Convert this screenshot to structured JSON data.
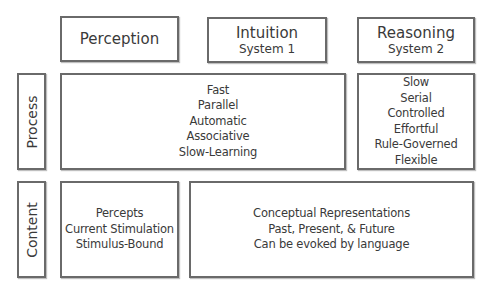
{
  "columns": {
    "perception": {
      "title": "Perception"
    },
    "intuition": {
      "title": "Intuition",
      "subtitle": "System 1"
    },
    "reasoning": {
      "title": "Reasoning",
      "subtitle": "System 2"
    }
  },
  "rows": {
    "process": {
      "label": "Process"
    },
    "content": {
      "label": "Content"
    }
  },
  "cells": {
    "process_shared": [
      "Fast",
      "Parallel",
      "Automatic",
      "Associative",
      "Slow-Learning"
    ],
    "process_reasoning": [
      "Slow",
      "Serial",
      "Controlled",
      "Effortful",
      "Rule-Governed",
      "Flexible"
    ],
    "content_perception": [
      "Percepts",
      "Current Stimulation",
      "Stimulus-Bound"
    ],
    "content_shared": [
      "Conceptual Representations",
      "Past, Present, & Future",
      "Can be evoked by language"
    ]
  }
}
